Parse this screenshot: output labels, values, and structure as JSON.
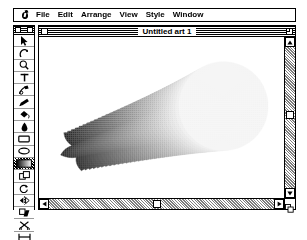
{
  "app": {
    "name": "Adobe Illustrator",
    "platform": "Macintosh System 6"
  },
  "menubar": {
    "apple_icon": "apple-icon",
    "items": [
      {
        "label": "File"
      },
      {
        "label": "Edit"
      },
      {
        "label": "Arrange"
      },
      {
        "label": "View"
      },
      {
        "label": "Style"
      },
      {
        "label": "Window"
      }
    ]
  },
  "tool_palette": {
    "title": "",
    "close_box": "close-box",
    "zoom_box": "zoom-box",
    "selected_index": 9,
    "tools": [
      {
        "name": "selection-arrow-tool",
        "icon": "arrow-icon"
      },
      {
        "name": "direct-selection-tool",
        "icon": "hollow-arrow-icon"
      },
      {
        "name": "zoom-tool",
        "icon": "magnifier-icon"
      },
      {
        "name": "type-tool",
        "icon": "text-t-icon"
      },
      {
        "name": "scissors-pen-tool",
        "icon": "pen-nib-icon"
      },
      {
        "name": "freehand-tool",
        "icon": "pencil-icon"
      },
      {
        "name": "paint-bucket-tool",
        "icon": "paint-bucket-icon"
      },
      {
        "name": "ink-dropper-tool",
        "icon": "eyedropper-icon"
      },
      {
        "name": "rectangle-tool",
        "icon": "rectangle-icon"
      },
      {
        "name": "oval-tool",
        "icon": "ellipse-icon"
      },
      {
        "name": "blend-tool",
        "icon": "blend-gradient-icon"
      },
      {
        "name": "scale-tool",
        "icon": "scale-icon"
      },
      {
        "name": "rotate-tool",
        "icon": "rotate-icon"
      },
      {
        "name": "reflect-tool",
        "icon": "reflect-icon"
      },
      {
        "name": "shear-tool",
        "icon": "shear-icon"
      },
      {
        "name": "cut-tool",
        "icon": "scissors-icon"
      },
      {
        "name": "measure-tool",
        "icon": "measure-icon"
      },
      {
        "name": "page-tool",
        "icon": "page-icon"
      }
    ]
  },
  "document": {
    "title": "Untitled art 1",
    "close_box": "close-box",
    "zoom_box": "zoom-box"
  },
  "scrollbars": {
    "vertical": {
      "thumb_position_pct": 46,
      "up_arrow": "scroll-up-arrow",
      "down_arrow": "scroll-down-arrow"
    },
    "horizontal": {
      "thumb_position_pct": 47,
      "left_arrow": "scroll-left-arrow",
      "right_arrow": "scroll-right-arrow"
    }
  },
  "artwork": {
    "description": "Blend from a dark angular polygon on the lower-left to a light dithered circle on the upper-right",
    "start_shape": "angular-polygon",
    "end_shape": "circle",
    "start_fill": "#000000",
    "end_fill": "#f2f2f2",
    "steps": 34
  }
}
